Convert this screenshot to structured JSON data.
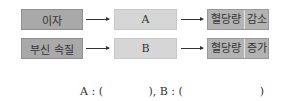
{
  "diagram": {
    "rows": [
      {
        "cause": "이자",
        "middle": "A",
        "result_part1": "혈당량",
        "result_part2": "감소"
      },
      {
        "cause": "부신 속질",
        "middle": "B",
        "result_part1": "혈당량",
        "result_part2": "증가"
      }
    ],
    "answer_line": "A : (             ), B : (                      )"
  }
}
